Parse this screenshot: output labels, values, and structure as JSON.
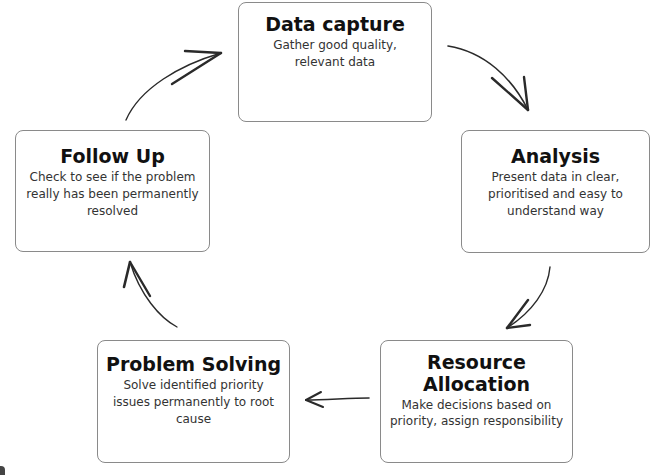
{
  "diagram": {
    "type": "cycle",
    "steps": [
      {
        "id": "data-capture",
        "title": "Data capture",
        "description": "Gather good quality, relevant data"
      },
      {
        "id": "analysis",
        "title": "Analysis",
        "description": "Present data in clear, prioritised and easy to understand way"
      },
      {
        "id": "resource-allocation",
        "title": "Resource Allocation",
        "description": "Make decisions based on priority, assign responsibility"
      },
      {
        "id": "problem-solving",
        "title": "Problem Solving",
        "description": "Solve identified priority issues permanently to root cause"
      },
      {
        "id": "follow-up",
        "title": "Follow Up",
        "description": "Check to see if the problem really has been permanently resolved"
      }
    ],
    "flow": [
      {
        "from": "data-capture",
        "to": "analysis"
      },
      {
        "from": "analysis",
        "to": "resource-allocation"
      },
      {
        "from": "resource-allocation",
        "to": "problem-solving"
      },
      {
        "from": "problem-solving",
        "to": "follow-up"
      },
      {
        "from": "follow-up",
        "to": "data-capture"
      }
    ],
    "colors": {
      "border": "#8a8a8a",
      "text": "#111111",
      "arrow": "#2a2a2a",
      "background": "#ffffff"
    }
  }
}
